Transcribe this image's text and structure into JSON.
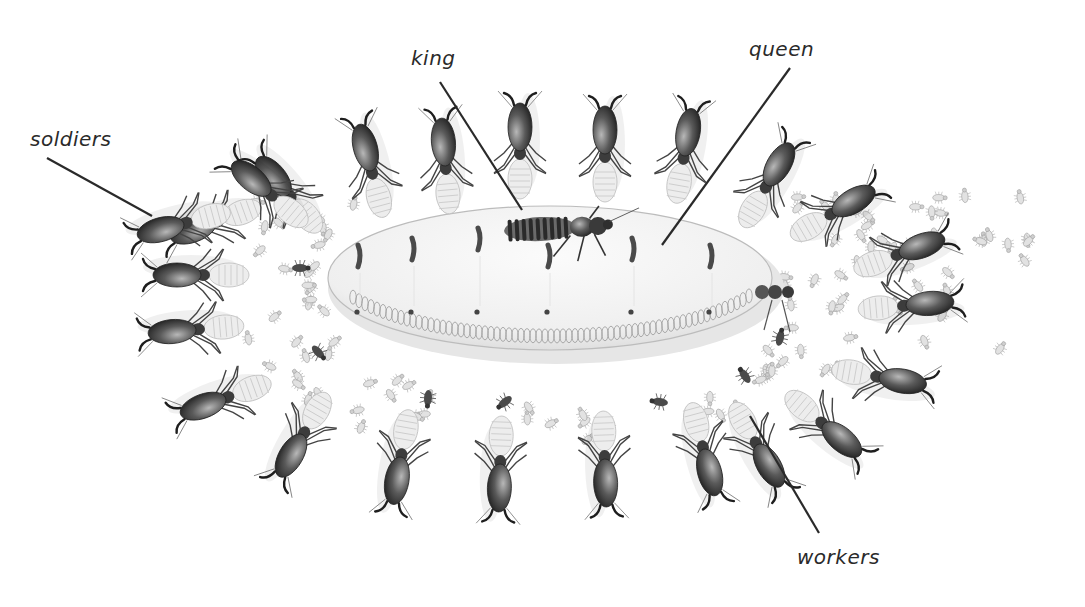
{
  "diagram": {
    "background_color": "#ffffff",
    "ink_color": "#2a2a2a",
    "labels": [
      {
        "id": "soldiers",
        "text": "soldiers",
        "x": 30,
        "y": 127,
        "line": [
          47,
          158,
          152,
          216
        ]
      },
      {
        "id": "king",
        "text": "king",
        "x": 411,
        "y": 46,
        "line": [
          440,
          82,
          522,
          210
        ]
      },
      {
        "id": "queen",
        "text": "queen",
        "x": 749,
        "y": 37,
        "line": [
          790,
          68,
          662,
          245
        ]
      },
      {
        "id": "workers",
        "text": "workers",
        "x": 797,
        "y": 545,
        "line": [
          750,
          416,
          819,
          533
        ]
      }
    ],
    "queen": {
      "cx": 550,
      "cy": 278,
      "rx": 222,
      "ry": 72,
      "color": "#f2f2f2",
      "segments": 7
    },
    "king": {
      "cx": 560,
      "cy": 228,
      "length": 100,
      "color": "#3a3a3a"
    },
    "soldier_count": 24,
    "worker_count": 110
  }
}
